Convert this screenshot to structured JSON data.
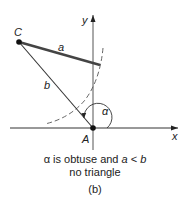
{
  "diagram": {
    "type": "geometry",
    "labels": {
      "point_c": "C",
      "point_a": "A",
      "side_a": "a",
      "side_b": "b",
      "angle": "α",
      "x_axis": "x",
      "y_axis": "y"
    },
    "points": {
      "A": [
        93,
        128
      ],
      "C": [
        19,
        42
      ],
      "a_end": [
        100,
        65
      ]
    },
    "colors": {
      "line": "#333333",
      "side_a": "#444444",
      "dashed_arc": "#555555"
    }
  },
  "caption": {
    "line1_prefix": "α is obtuse and",
    "line1_var_a": "a",
    "line1_op": " < ",
    "line1_var_b": "b",
    "line2": "no triangle",
    "panel": "(b)"
  }
}
